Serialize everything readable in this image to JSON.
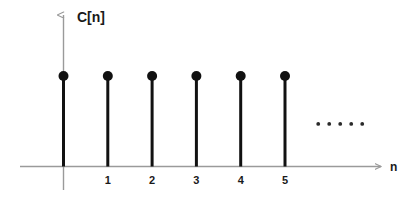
{
  "figure": {
    "background_color": "#ffffff",
    "width": 418,
    "height": 201
  },
  "chart_data": {
    "type": "scatter",
    "plot_style": "stem",
    "title": "",
    "subtitle": "",
    "xlabel": "n",
    "ylabel": "C[n]",
    "categories": [
      "0",
      "1",
      "2",
      "3",
      "4",
      "5"
    ],
    "x": [
      0,
      1,
      2,
      3,
      4,
      5
    ],
    "values": [
      1,
      1,
      1,
      1,
      1,
      1
    ],
    "series": [
      {
        "name": "C[n]",
        "values": [
          1,
          1,
          1,
          1,
          1,
          1
        ]
      }
    ],
    "xtick_labels": [
      "1",
      "2",
      "3",
      "4",
      "5"
    ],
    "xtick_values": [
      1,
      2,
      3,
      4,
      5
    ],
    "ytick_labels": [],
    "xlim": [
      -0.45,
      7.2
    ],
    "ylim": [
      0,
      1.28
    ],
    "grid": false,
    "legend": false,
    "legend_position": "none",
    "annotations": [
      {
        "name": "continuation-ellipsis",
        "text": "• • • • •",
        "dot_count": 5,
        "x": 5.75,
        "y": 0.47,
        "meaning": "sequence continues"
      }
    ],
    "colors": {
      "stem": "#111111",
      "marker": "#111111",
      "axis": "#9a9a9a",
      "text": "#1a1a1a",
      "background": "#ffffff"
    },
    "marker_radius_px": 5,
    "stem_width_px": 3,
    "axis_width_px": 1.4
  },
  "axes": {
    "y_axis": {
      "label": "C[n]",
      "arrow": "up",
      "color": "#9a9a9a"
    },
    "x_axis": {
      "label": "n",
      "arrow": "right",
      "color": "#9a9a9a"
    }
  }
}
